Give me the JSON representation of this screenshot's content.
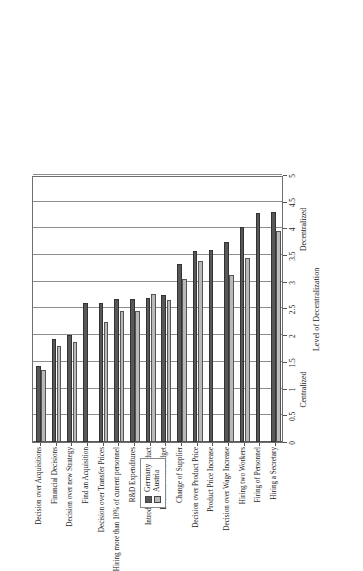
{
  "legend": {
    "position": "top-left-inside",
    "entries": [
      {
        "label": "Germany",
        "color": "#585858",
        "icon": "square-swatch-dark"
      },
      {
        "label": "Austria",
        "color": "#b9b9b9",
        "icon": "square-swatch-light"
      }
    ]
  },
  "axis": {
    "value_title": "Level of Decentralization",
    "tick_labels": [
      "0",
      "0.5",
      "1",
      "1.5",
      "2",
      "2.5",
      "3",
      "3.5",
      "4",
      "4.5",
      "5"
    ],
    "anchor_low": "Centralized",
    "anchor_high": "Decentralized"
  },
  "chart_data": {
    "type": "bar",
    "orientation": "horizontal",
    "title": "",
    "subtitle": "",
    "xlabel": "Level of Decentralization",
    "ylabel": "",
    "xlim": [
      0,
      5
    ],
    "xticks": [
      0,
      0.5,
      1,
      1.5,
      2,
      2.5,
      3,
      3.5,
      4,
      4.5,
      5
    ],
    "grid": true,
    "legend_position": "top-left",
    "annotations": [
      {
        "text": "Centralized",
        "value": 1.0
      },
      {
        "text": "Decentralized",
        "value": 4.0
      }
    ],
    "categories": [
      "Decision over Acquisitions",
      "Financial Decisions",
      "Decision over new Strategy",
      "Find an Acquisition",
      "Decision over Transfer Prices",
      "Hiring more than 10% of current personnel",
      "R&D Expenditures",
      "Introducing a New Product",
      "Decision over Budget",
      "Change of Supplier",
      "Decision over Product Price",
      "Product Price Increase",
      "Decision over Wage Increase",
      "Hiring two Workers",
      "Firing of Personnel",
      "Hiring a Secretary"
    ],
    "series": [
      {
        "name": "Germany",
        "color": "#585858",
        "values": [
          1.42,
          1.93,
          2.01,
          2.6,
          2.6,
          2.67,
          2.67,
          2.7,
          2.76,
          3.33,
          3.57,
          3.6,
          3.74,
          4.02,
          4.28,
          4.3
        ]
      },
      {
        "name": "Austria",
        "color": "#b9b9b9",
        "values": [
          1.35,
          1.79,
          1.87,
          null,
          2.25,
          2.45,
          2.46,
          2.77,
          2.65,
          3.05,
          3.39,
          null,
          3.12,
          3.45,
          null,
          3.96
        ]
      }
    ]
  }
}
